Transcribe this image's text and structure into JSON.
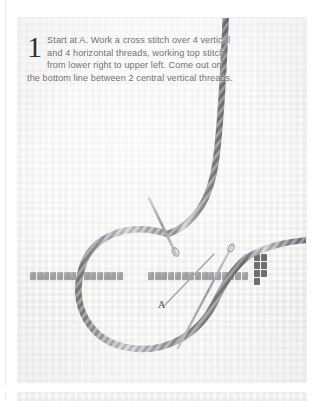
{
  "page": {
    "background_color": "#ffffff",
    "panel_background_color": "#fbfbfa"
  },
  "figure": {
    "step_number": "1",
    "caption": "Start at A. Work a cross stitch over 4 vertical and 4 horizontal threads, working top stitch from lower right to upper left. Come out on the bottom line between 2 central vertical threads.",
    "caption_color": "#6f6f70",
    "step_number_color": "#2e2e2f"
  },
  "labels": {
    "point_a": "A"
  },
  "materials": {
    "fabric_name": "aida-cloth",
    "fabric_color": "#fcfcfb",
    "thread_name": "twisted-cord",
    "thread_color": "#9a9a9c",
    "thread_highlight": "#d8d8da",
    "thread_shadow": "#6e6e71",
    "needle_color": "#b6b6bb",
    "worked_stitch_color": "#8e8e90",
    "dark_stitch_color": "#55565a"
  },
  "elements": {
    "needle_upper_name": "needle-upper",
    "needle_lower_name": "needle-lower",
    "cord_loop_name": "thread-loop",
    "cord_tail_name": "thread-tail",
    "stitch_row_name": "worked-stitch-row"
  }
}
